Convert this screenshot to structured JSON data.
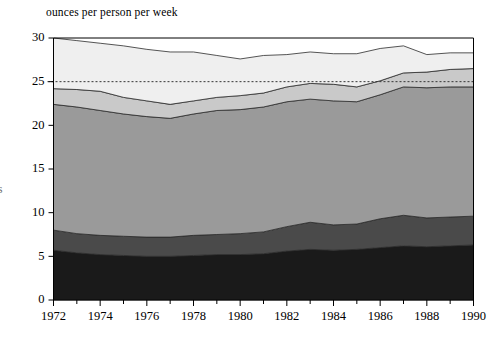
{
  "chart_data": {
    "type": "area",
    "stacked": true,
    "title": "",
    "subtitle": "",
    "ylabel": "ounces per person per week",
    "xlabel": "",
    "grid": false,
    "legend_position": "none",
    "xlim": [
      1972,
      1990
    ],
    "ylim": [
      0,
      30
    ],
    "ytick_step": 5,
    "yticks": [
      0,
      5,
      10,
      15,
      20,
      25,
      30
    ],
    "xticks": [
      1972,
      1974,
      1976,
      1978,
      1980,
      1982,
      1984,
      1986,
      1988,
      1990
    ],
    "xtick_labels": [
      "1972",
      "1974",
      "1976",
      "1978",
      "1980",
      "1982",
      "1984",
      "1986",
      "1988",
      "1990"
    ],
    "ytick_labels": [
      "0",
      "5",
      "10",
      "15",
      "20",
      "25",
      "30"
    ],
    "minor_xticks_every": 1,
    "x": [
      1972,
      1973,
      1974,
      1975,
      1976,
      1977,
      1978,
      1979,
      1980,
      1981,
      1982,
      1983,
      1984,
      1985,
      1986,
      1987,
      1988,
      1989,
      1990
    ],
    "annotations": [
      {
        "type": "dashed-hline",
        "y": 25,
        "label": "",
        "color": "#333333"
      }
    ],
    "series": [
      {
        "name": "band-1-bottom",
        "color": "#1a1a1a",
        "values": [
          5.7,
          5.4,
          5.2,
          5.1,
          5.0,
          5.0,
          5.1,
          5.2,
          5.2,
          5.3,
          5.6,
          5.8,
          5.7,
          5.8,
          6.0,
          6.2,
          6.1,
          6.2,
          6.3
        ]
      },
      {
        "name": "band-2",
        "color": "#4a4a4a",
        "values": [
          2.3,
          2.2,
          2.2,
          2.2,
          2.2,
          2.2,
          2.3,
          2.3,
          2.4,
          2.5,
          2.8,
          3.1,
          2.9,
          2.9,
          3.3,
          3.5,
          3.3,
          3.3,
          3.3
        ]
      },
      {
        "name": "band-3-main",
        "color": "#9a9a9a",
        "values": [
          14.4,
          14.5,
          14.3,
          14.0,
          13.8,
          13.6,
          13.9,
          14.2,
          14.2,
          14.3,
          14.3,
          14.1,
          14.2,
          14.0,
          14.2,
          14.7,
          14.9,
          14.9,
          14.8
        ]
      },
      {
        "name": "band-4",
        "color": "#c9c9c9",
        "values": [
          1.8,
          2.0,
          2.2,
          1.9,
          1.8,
          1.6,
          1.5,
          1.5,
          1.6,
          1.6,
          1.7,
          1.8,
          1.9,
          1.7,
          1.6,
          1.6,
          1.8,
          2.0,
          2.1
        ]
      },
      {
        "name": "band-5-top",
        "color": "#efefef",
        "values": [
          5.8,
          5.6,
          5.5,
          5.9,
          5.9,
          6.0,
          5.6,
          4.8,
          4.2,
          4.3,
          3.7,
          3.6,
          3.5,
          3.8,
          3.7,
          3.1,
          2.0,
          1.9,
          1.8
        ]
      }
    ],
    "totals": [
      30.0,
      29.7,
      29.4,
      29.1,
      28.7,
      28.4,
      28.4,
      28.0,
      27.6,
      28.0,
      28.1,
      28.4,
      28.2,
      28.2,
      28.8,
      29.1,
      28.1,
      28.3,
      28.3
    ],
    "axis_color": "#000000",
    "plot_background": "#ffffff"
  },
  "figure": {
    "axis_title_text": "ounces per person per week",
    "clipped_left_glyph": "s"
  }
}
